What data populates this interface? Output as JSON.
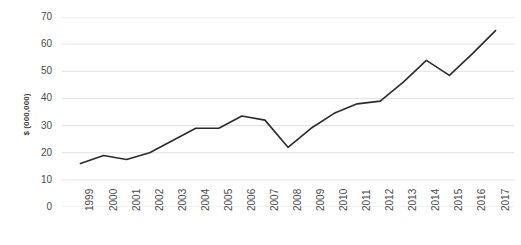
{
  "chart_data": {
    "type": "line",
    "title": "",
    "xlabel": "",
    "ylabel": "$ (000,000)",
    "categories": [
      "1999",
      "2000",
      "2001",
      "2002",
      "2003",
      "2004",
      "2005",
      "2006",
      "2007",
      "2008",
      "2009",
      "2010",
      "2011",
      "2012",
      "2013",
      "2014",
      "2015",
      "2016",
      "2017"
    ],
    "values": [
      16,
      19,
      17.5,
      20,
      24.5,
      29,
      29,
      33.5,
      32,
      22,
      29,
      34.5,
      38,
      39,
      46,
      54,
      48.5,
      56.5,
      65
    ],
    "series": [
      {
        "name": "Revenue",
        "values": [
          16,
          19,
          17.5,
          20,
          24.5,
          29,
          29,
          33.5,
          32,
          22,
          29,
          34.5,
          38,
          39,
          46,
          54,
          48.5,
          56.5,
          65
        ]
      }
    ],
    "ylim": [
      0,
      70
    ],
    "yticks": [
      0,
      10,
      20,
      30,
      40,
      50,
      60,
      70
    ],
    "ytick_labels": [
      "0",
      "10",
      "20",
      "30",
      "40",
      "50",
      "60",
      "70"
    ],
    "xtick_labels": [
      "1999",
      "2000",
      "2001",
      "2002",
      "2003",
      "2004",
      "2005",
      "2006",
      "2007",
      "2008",
      "2009",
      "2010",
      "2011",
      "2012",
      "2013",
      "2014",
      "2015",
      "2016",
      "2017"
    ],
    "grid": true,
    "grid_axis": "y",
    "legend": false,
    "legend_position": "none",
    "line_color": "#2b2b2b",
    "grid_color": "#e2e2e2",
    "text_color": "#4a4a4a",
    "background_color": "#ffffff",
    "markers": false
  }
}
